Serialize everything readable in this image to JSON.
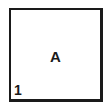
{
  "box": {
    "label": "A",
    "number": "1",
    "border_color": "#1a1a1a"
  }
}
